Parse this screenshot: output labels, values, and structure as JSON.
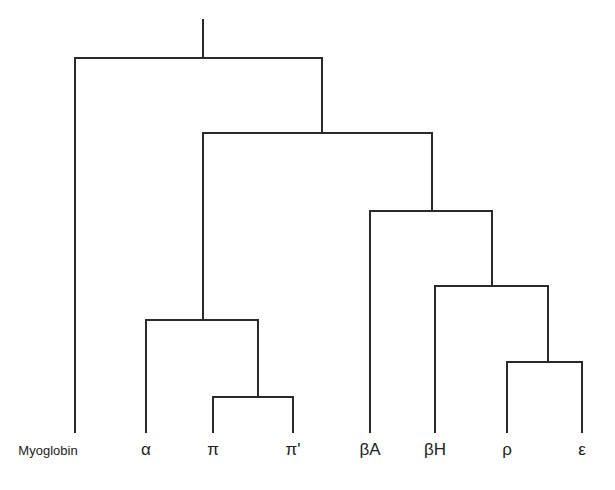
{
  "diagram": {
    "type": "dendrogram",
    "leaves": [
      {
        "id": "myoglobin",
        "label": "Myoglobin",
        "x": 75
      },
      {
        "id": "alpha",
        "label": "α",
        "x": 146
      },
      {
        "id": "pi",
        "label": "π",
        "x": 213
      },
      {
        "id": "pi-prime",
        "label": "π'",
        "x": 293
      },
      {
        "id": "beta-a",
        "label": "βA",
        "x": 370
      },
      {
        "id": "beta-h",
        "label": "βH",
        "x": 435
      },
      {
        "id": "rho",
        "label": "ρ",
        "x": 507
      },
      {
        "id": "epsilon",
        "label": "ε",
        "x": 582
      }
    ],
    "clusters": [
      "((Myoglobin, ((α, (π, π')), (βA, (βH, (ρ, ε))))))"
    ]
  }
}
